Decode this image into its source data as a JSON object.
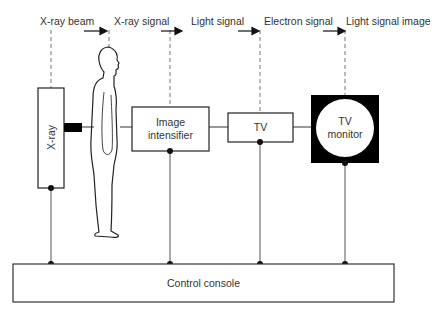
{
  "diagram": {
    "signal_labels": [
      "X-ray beam",
      "X-ray signal",
      "Light signal",
      "Electron signal",
      "Light signal image"
    ],
    "components": {
      "xray": "X-ray",
      "intensifier_line1": "Image",
      "intensifier_line2": "intensifier",
      "tv": "TV",
      "monitor_line1": "TV",
      "monitor_line2": "monitor",
      "console": "Control console"
    },
    "colors": {
      "line": "#2a2a2a",
      "dashed": "#666666",
      "monitor_fill": "#000000"
    }
  }
}
